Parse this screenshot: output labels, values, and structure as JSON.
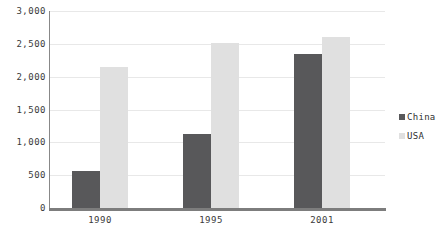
{
  "chart_data": {
    "type": "bar",
    "title": "",
    "xlabel": "",
    "ylabel": "",
    "categories": [
      "1990",
      "1995",
      "2001"
    ],
    "series": [
      {
        "name": "China",
        "color": "#58585a",
        "values": [
          570,
          1120,
          2340
        ]
      },
      {
        "name": "USA",
        "color": "#e0e0e0",
        "values": [
          2150,
          2520,
          2600
        ]
      }
    ],
    "ylim": [
      0,
      3000
    ],
    "ytick_values": [
      0,
      500,
      1000,
      1500,
      2000,
      2500,
      3000
    ],
    "ytick_labels": [
      "0",
      "500",
      "1,000",
      "1,500",
      "2,000",
      "2,500",
      "3,000"
    ],
    "grid": true,
    "legend_position": "right"
  },
  "axis": {
    "line_color": "#7d7d7d",
    "grid_color": "#e8e8e8"
  },
  "legend": {
    "items": [
      {
        "label": "China",
        "color": "#58585a"
      },
      {
        "label": "USA",
        "color": "#e0e0e0"
      }
    ]
  }
}
